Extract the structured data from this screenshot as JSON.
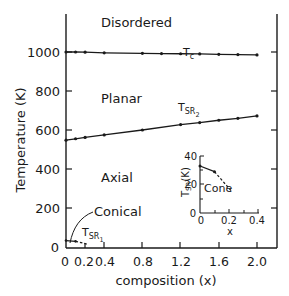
{
  "chart_data": {
    "type": "line",
    "title": "",
    "xlabel": "composition (x)",
    "ylabel": "Temperature (K)",
    "xlim": [
      0,
      2.0
    ],
    "ylim": [
      0,
      1150
    ],
    "xticks": [
      "0",
      "0.2",
      "0.4",
      "0.8",
      "1.2",
      "1.6",
      "2.0"
    ],
    "yticks": [
      "0",
      "200",
      "400",
      "600",
      "800",
      "1000"
    ],
    "grid": false,
    "regions": [
      "Disordered",
      "Planar",
      "Axial",
      "Conical"
    ],
    "series": [
      {
        "name": "Tc",
        "label_main": "T",
        "label_sub": "c",
        "x": [
          0,
          0.1,
          0.2,
          0.4,
          0.8,
          1.0,
          1.2,
          1.4,
          1.6,
          1.8,
          2.0
        ],
        "y": [
          1000,
          1000,
          999,
          996,
          993,
          992,
          991,
          990,
          988,
          987,
          985
        ]
      },
      {
        "name": "TSR2",
        "label_main": "T",
        "label_sub": "SR",
        "label_subsub": "2",
        "x": [
          0,
          0.1,
          0.2,
          0.4,
          0.8,
          1.2,
          1.4,
          1.6,
          1.8,
          2.0
        ],
        "y": [
          548,
          555,
          562,
          575,
          600,
          628,
          638,
          650,
          660,
          672
        ]
      },
      {
        "name": "TSR1",
        "label_main": "T",
        "label_sub": "SR",
        "label_subsub": "1",
        "x": [
          0,
          0.1,
          0.22
        ],
        "y": [
          33,
          29,
          15
        ],
        "style": "solid then dashed"
      }
    ],
    "inset": {
      "xlabel": "x",
      "ylabel": "T_SR (K)",
      "ylabel_main": "T",
      "ylabel_sub": "SR",
      "ylabel_unit": "(K)",
      "xlim": [
        0,
        0.4
      ],
      "ylim": [
        0,
        40
      ],
      "xticks": [
        "0",
        "0.2",
        "0.4"
      ],
      "yticks": [
        "0",
        "20",
        "40"
      ],
      "region_label": "Cone",
      "x": [
        0,
        0.1,
        0.22
      ],
      "y": [
        33,
        29,
        15
      ]
    }
  }
}
